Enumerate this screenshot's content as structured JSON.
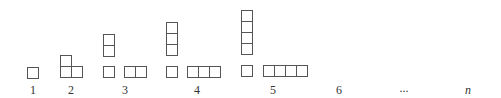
{
  "diagram": {
    "colors": {
      "stroke": "#555555",
      "label": "#333333",
      "background": "#ffffff"
    },
    "cell_size": 11,
    "labels": [
      {
        "id": "1",
        "text": "1",
        "x": 33,
        "y": 84
      },
      {
        "id": "2",
        "text": "2",
        "x": 71,
        "y": 84
      },
      {
        "id": "3",
        "text": "3",
        "x": 125,
        "y": 84
      },
      {
        "id": "4",
        "text": "4",
        "x": 197,
        "y": 84
      },
      {
        "id": "5",
        "text": "5",
        "x": 273,
        "y": 84
      },
      {
        "id": "6",
        "text": "6",
        "x": 339,
        "y": 84
      },
      {
        "id": "ellipsis",
        "text": "...",
        "x": 404,
        "y": 82
      },
      {
        "id": "n",
        "text": "n",
        "x": 468,
        "y": 84,
        "italic": true
      }
    ],
    "figures": [
      {
        "n": 1,
        "cells": [
          {
            "x": 27,
            "y": 67
          }
        ]
      },
      {
        "n": 2,
        "cells": [
          {
            "x": 60,
            "y": 55
          },
          {
            "x": 60,
            "y": 66
          },
          {
            "x": 71,
            "y": 66
          }
        ]
      },
      {
        "n": 3,
        "cells": [
          {
            "x": 103,
            "y": 34
          },
          {
            "x": 103,
            "y": 45
          },
          {
            "x": 103,
            "y": 66
          },
          {
            "x": 124,
            "y": 66
          },
          {
            "x": 135,
            "y": 66
          }
        ]
      },
      {
        "n": 4,
        "cells": [
          {
            "x": 166,
            "y": 22
          },
          {
            "x": 166,
            "y": 33
          },
          {
            "x": 166,
            "y": 44
          },
          {
            "x": 166,
            "y": 66
          },
          {
            "x": 187,
            "y": 66
          },
          {
            "x": 198,
            "y": 66
          },
          {
            "x": 209,
            "y": 66
          }
        ]
      },
      {
        "n": 5,
        "cells": [
          {
            "x": 241,
            "y": 10
          },
          {
            "x": 241,
            "y": 21
          },
          {
            "x": 241,
            "y": 32
          },
          {
            "x": 241,
            "y": 43
          },
          {
            "x": 241,
            "y": 65
          },
          {
            "x": 263,
            "y": 65
          },
          {
            "x": 274,
            "y": 65
          },
          {
            "x": 285,
            "y": 65
          },
          {
            "x": 296,
            "y": 65
          }
        ]
      }
    ]
  }
}
